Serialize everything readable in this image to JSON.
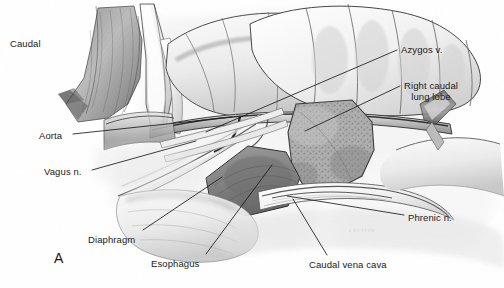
{
  "figure": {
    "panel_letter": "A",
    "signature": "cortiva",
    "background_color": "#ffffff",
    "ink_color": "#1b1b1b",
    "medium": "graphite pencil anatomical illustration"
  },
  "labels": [
    {
      "id": "caudal",
      "text": "Caudal",
      "x": 10,
      "y": 38,
      "align": "left",
      "has_leader": false
    },
    {
      "id": "aorta",
      "text": "Aorta",
      "x": 39,
      "y": 130,
      "align": "left",
      "has_leader": true,
      "leader": {
        "x1": 73,
        "y1": 134,
        "x2": 232,
        "y2": 117
      }
    },
    {
      "id": "vagus-nerve",
      "text": "Vagus n.",
      "x": 44,
      "y": 166,
      "align": "left",
      "has_leader": true,
      "leader": {
        "x1": 92,
        "y1": 170,
        "x2": 196,
        "y2": 141
      }
    },
    {
      "id": "azygos-vein",
      "text": "Azygos v.",
      "x": 401,
      "y": 44,
      "align": "left",
      "has_leader": true,
      "leader": {
        "x1": 397,
        "y1": 50,
        "x2": 206,
        "y2": 132
      }
    },
    {
      "id": "right-caudal-lung-lobe",
      "text": "Right caudal\nlung lobe",
      "x": 404,
      "y": 80,
      "align": "left",
      "has_leader": true,
      "leader": {
        "x1": 400,
        "y1": 86,
        "x2": 305,
        "y2": 131
      }
    },
    {
      "id": "phrenic-nerve",
      "text": "Phrenic n.",
      "x": 408,
      "y": 212,
      "align": "left",
      "has_leader": true,
      "leader": {
        "x1": 404,
        "y1": 215,
        "x2": 287,
        "y2": 196
      }
    },
    {
      "id": "caudal-vena-cava",
      "text": "Caudal vena cava",
      "x": 309,
      "y": 259,
      "align": "left",
      "has_leader": true,
      "leader": {
        "x1": 327,
        "y1": 255,
        "x2": 293,
        "y2": 199
      }
    },
    {
      "id": "esophagus",
      "text": "Esophagus",
      "x": 151,
      "y": 258,
      "align": "left",
      "has_leader": true,
      "leader": {
        "x1": 206,
        "y1": 254,
        "x2": 272,
        "y2": 165
      }
    },
    {
      "id": "diaphragm",
      "text": "Diaphragm",
      "x": 88,
      "y": 234,
      "align": "left",
      "has_leader": true,
      "leader": {
        "x1": 143,
        "y1": 230,
        "x2": 222,
        "y2": 177
      }
    }
  ]
}
